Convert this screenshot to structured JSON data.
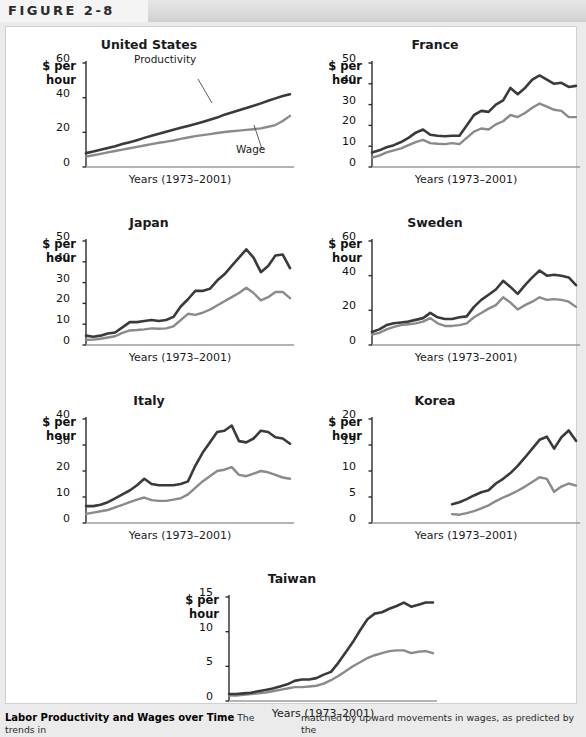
{
  "figure": {
    "label": "FIGURE 2-8"
  },
  "caption": {
    "title": "Labor Productivity and Wages over Time",
    "col1": "The trends in",
    "col2": "matched by upward movements in wages, as predicted by the"
  },
  "axis": {
    "y_label_line1": "$ per",
    "y_label_line2": "hour",
    "x_label": "Years (1973–2001)"
  },
  "annotations": {
    "productivity": "Productivity",
    "wage": "Wage"
  },
  "colors": {
    "productivity": "#3a3a3a",
    "wage": "#8a8a8a",
    "axis": "#2b2b2b",
    "baseline": "#9b9b9b",
    "panel_bg": "#ffffff",
    "page_bg": "#ebebeb",
    "header_band": "#dcdcdc"
  },
  "chart_data": [
    {
      "type": "line",
      "title": "United States",
      "xlabel": "Years (1973–2001)",
      "ylabel": "$ per hour",
      "ylim": [
        0,
        60
      ],
      "yticks": [
        0,
        20,
        40,
        60
      ],
      "x": [
        1973,
        1974,
        1975,
        1976,
        1977,
        1978,
        1979,
        1980,
        1981,
        1982,
        1983,
        1984,
        1985,
        1986,
        1987,
        1988,
        1989,
        1990,
        1991,
        1992,
        1993,
        1994,
        1995,
        1996,
        1997,
        1998,
        1999,
        2000,
        2001
      ],
      "series": [
        {
          "name": "Productivity",
          "values": [
            8.0,
            9.0,
            10.0,
            11.0,
            12.0,
            13.2,
            14.3,
            15.5,
            16.8,
            18.0,
            19.2,
            20.3,
            21.5,
            22.6,
            23.7,
            24.8,
            26.0,
            27.2,
            28.5,
            30.2,
            31.5,
            32.8,
            34.0,
            35.3,
            36.7,
            38.2,
            39.6,
            41.0,
            42.0
          ]
        },
        {
          "name": "Wage",
          "values": [
            6.0,
            6.8,
            7.6,
            8.4,
            9.2,
            10.0,
            10.8,
            11.6,
            12.4,
            13.2,
            14.0,
            14.6,
            15.3,
            16.2,
            17.0,
            17.8,
            18.4,
            19.0,
            19.6,
            20.2,
            20.6,
            21.0,
            21.4,
            21.8,
            22.3,
            23.2,
            24.2,
            26.5,
            29.5
          ]
        }
      ],
      "grid": false,
      "legend": "inline-annotations"
    },
    {
      "type": "line",
      "title": "France",
      "xlabel": "Years (1973–2001)",
      "ylabel": "$ per hour",
      "ylim": [
        0,
        50
      ],
      "yticks": [
        0,
        10,
        20,
        30,
        40,
        50
      ],
      "x": [
        1973,
        1974,
        1975,
        1976,
        1977,
        1978,
        1979,
        1980,
        1981,
        1982,
        1983,
        1984,
        1985,
        1986,
        1987,
        1988,
        1989,
        1990,
        1991,
        1992,
        1993,
        1994,
        1995,
        1996,
        1997,
        1998,
        1999,
        2000,
        2001
      ],
      "series": [
        {
          "name": "Productivity",
          "values": [
            7.0,
            8.0,
            9.5,
            10.5,
            12.0,
            14.0,
            16.5,
            18.0,
            15.5,
            15.0,
            14.8,
            15.0,
            15.0,
            20.0,
            25.0,
            27.0,
            26.5,
            30.0,
            32.0,
            38.0,
            35.0,
            38.0,
            42.0,
            44.0,
            42.0,
            40.0,
            40.5,
            38.5,
            39.0
          ]
        },
        {
          "name": "Wage",
          "values": [
            4.5,
            5.5,
            7.0,
            8.0,
            9.0,
            10.5,
            12.0,
            13.0,
            11.5,
            11.2,
            11.0,
            11.5,
            11.0,
            14.0,
            17.0,
            18.5,
            18.0,
            20.5,
            22.0,
            25.0,
            24.0,
            26.0,
            28.5,
            30.5,
            29.0,
            27.5,
            27.0,
            24.0,
            24.0
          ]
        }
      ],
      "grid": false,
      "legend": "none"
    },
    {
      "type": "line",
      "title": "Japan",
      "xlabel": "Years (1973–2001)",
      "ylabel": "$ per hour",
      "ylim": [
        0,
        50
      ],
      "yticks": [
        0,
        10,
        20,
        30,
        40,
        50
      ],
      "x": [
        1973,
        1974,
        1975,
        1976,
        1977,
        1978,
        1979,
        1980,
        1981,
        1982,
        1983,
        1984,
        1985,
        1986,
        1987,
        1988,
        1989,
        1990,
        1991,
        1992,
        1993,
        1994,
        1995,
        1996,
        1997,
        1998,
        1999,
        2000,
        2001
      ],
      "series": [
        {
          "name": "Productivity",
          "values": [
            4.5,
            4.0,
            4.5,
            5.5,
            6.0,
            8.5,
            11.0,
            11.0,
            11.5,
            12.0,
            11.5,
            12.0,
            13.5,
            18.5,
            22.0,
            26.0,
            26.0,
            27.0,
            31.0,
            34.0,
            38.0,
            42.0,
            46.0,
            42.0,
            35.0,
            38.0,
            43.0,
            43.5,
            37.0
          ]
        },
        {
          "name": "Wage",
          "values": [
            2.5,
            2.6,
            3.0,
            3.6,
            4.2,
            5.8,
            7.0,
            7.2,
            7.5,
            8.0,
            7.8,
            8.0,
            9.0,
            12.0,
            15.0,
            14.5,
            15.5,
            17.0,
            19.0,
            21.0,
            23.0,
            25.0,
            27.5,
            25.0,
            21.5,
            23.0,
            25.5,
            25.5,
            22.5
          ]
        }
      ],
      "grid": false,
      "legend": "none"
    },
    {
      "type": "line",
      "title": "Sweden",
      "xlabel": "Years (1973–2001)",
      "ylabel": "$ per hour",
      "ylim": [
        0,
        60
      ],
      "yticks": [
        0,
        20,
        40,
        60
      ],
      "x": [
        1973,
        1974,
        1975,
        1976,
        1977,
        1978,
        1979,
        1980,
        1981,
        1982,
        1983,
        1984,
        1985,
        1986,
        1987,
        1988,
        1989,
        1990,
        1991,
        1992,
        1993,
        1994,
        1995,
        1996,
        1997,
        1998,
        1999,
        2000,
        2001
      ],
      "series": [
        {
          "name": "Productivity",
          "values": [
            7.5,
            9.0,
            11.5,
            12.5,
            13.0,
            13.5,
            14.5,
            15.5,
            18.5,
            16.0,
            15.0,
            15.0,
            16.0,
            16.5,
            22.0,
            26.0,
            29.0,
            32.0,
            37.0,
            33.5,
            29.5,
            34.5,
            39.0,
            43.0,
            40.0,
            40.5,
            40.0,
            39.0,
            34.5
          ]
        },
        {
          "name": "Wage",
          "values": [
            6.0,
            7.0,
            9.0,
            10.5,
            11.5,
            12.0,
            12.5,
            13.5,
            15.5,
            12.5,
            11.0,
            11.0,
            11.5,
            12.5,
            16.0,
            18.5,
            21.0,
            23.0,
            27.5,
            24.5,
            20.5,
            23.0,
            25.0,
            27.5,
            26.0,
            26.5,
            26.0,
            25.0,
            22.0
          ]
        }
      ],
      "grid": false,
      "legend": "none"
    },
    {
      "type": "line",
      "title": "Italy",
      "xlabel": "Years (1973–2001)",
      "ylabel": "$ per hour",
      "ylim": [
        0,
        40
      ],
      "yticks": [
        0,
        10,
        20,
        30,
        40
      ],
      "x": [
        1973,
        1974,
        1975,
        1976,
        1977,
        1978,
        1979,
        1980,
        1981,
        1982,
        1983,
        1984,
        1985,
        1986,
        1987,
        1988,
        1989,
        1990,
        1991,
        1992,
        1993,
        1994,
        1995,
        1996,
        1997,
        1998,
        1999,
        2000,
        2001
      ],
      "series": [
        {
          "name": "Productivity",
          "values": [
            6.5,
            6.5,
            7.0,
            8.0,
            9.5,
            11.0,
            12.5,
            14.5,
            17.0,
            15.0,
            14.5,
            14.5,
            14.5,
            15.0,
            16.0,
            22.0,
            27.0,
            31.0,
            35.0,
            35.5,
            37.5,
            31.5,
            31.0,
            32.5,
            35.5,
            35.0,
            33.0,
            32.5,
            30.5
          ]
        },
        {
          "name": "Wage",
          "values": [
            3.5,
            4.0,
            4.5,
            5.0,
            6.0,
            7.0,
            8.0,
            9.0,
            9.8,
            8.8,
            8.5,
            8.5,
            9.0,
            9.5,
            11.0,
            13.5,
            16.0,
            18.0,
            20.0,
            20.5,
            21.5,
            18.5,
            18.0,
            19.0,
            20.0,
            19.5,
            18.5,
            17.5,
            17.0
          ]
        }
      ],
      "grid": false,
      "legend": "none"
    },
    {
      "type": "line",
      "title": "Korea",
      "xlabel": "Years (1973–2001)",
      "ylabel": "$ per hour",
      "ylim": [
        0,
        20
      ],
      "yticks": [
        0,
        5,
        10,
        15,
        20
      ],
      "x": [
        1984,
        1985,
        1986,
        1987,
        1988,
        1989,
        1990,
        1991,
        1992,
        1993,
        1994,
        1995,
        1996,
        1997,
        1998,
        1999,
        2000,
        2001
      ],
      "series": [
        {
          "name": "Productivity",
          "values": [
            3.6,
            4.0,
            4.6,
            5.3,
            5.9,
            6.3,
            7.6,
            8.5,
            9.6,
            11.0,
            12.6,
            14.3,
            16.0,
            16.6,
            14.3,
            16.5,
            17.8,
            15.8
          ]
        },
        {
          "name": "Wage",
          "values": [
            1.7,
            1.6,
            1.9,
            2.3,
            2.8,
            3.4,
            4.2,
            4.9,
            5.5,
            6.2,
            7.0,
            7.9,
            8.8,
            8.5,
            6.0,
            7.0,
            7.6,
            7.2
          ]
        }
      ],
      "grid": false,
      "legend": "none"
    },
    {
      "type": "line",
      "title": "Taiwan",
      "xlabel": "Years (1973–2001)",
      "ylabel": "$ per hour",
      "ylim": [
        0,
        15
      ],
      "yticks": [
        0,
        5,
        10,
        15
      ],
      "x": [
        1973,
        1974,
        1975,
        1976,
        1977,
        1978,
        1979,
        1980,
        1981,
        1982,
        1983,
        1984,
        1985,
        1986,
        1987,
        1988,
        1989,
        1990,
        1991,
        1992,
        1993,
        1994,
        1995,
        1996,
        1997,
        1998,
        1999,
        2000,
        2001
      ],
      "series": [
        {
          "name": "Productivity",
          "values": [
            1.0,
            1.0,
            1.1,
            1.2,
            1.4,
            1.6,
            1.8,
            2.1,
            2.4,
            2.9,
            3.1,
            3.1,
            3.3,
            3.8,
            4.2,
            5.5,
            7.0,
            8.5,
            10.2,
            11.8,
            12.6,
            12.8,
            13.3,
            13.7,
            14.2,
            13.6,
            13.9,
            14.2,
            14.2
          ]
        },
        {
          "name": "Wage",
          "values": [
            0.8,
            0.8,
            0.9,
            1.0,
            1.1,
            1.2,
            1.4,
            1.6,
            1.8,
            2.0,
            2.0,
            2.1,
            2.2,
            2.5,
            3.0,
            3.6,
            4.3,
            5.0,
            5.6,
            6.2,
            6.6,
            6.9,
            7.2,
            7.3,
            7.3,
            6.9,
            7.1,
            7.2,
            6.9
          ]
        }
      ],
      "grid": false,
      "legend": "none"
    }
  ]
}
